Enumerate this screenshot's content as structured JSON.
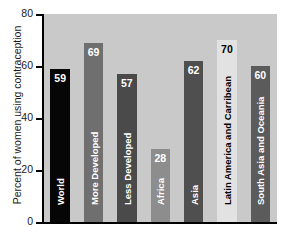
{
  "chart_data": {
    "type": "bar",
    "title": "",
    "xlabel": "",
    "ylabel": "Percent of women using contraception",
    "ylim": [
      0,
      80
    ],
    "yticks": [
      0,
      20,
      40,
      60,
      80
    ],
    "grid": false,
    "legend": false,
    "categories": [
      "World",
      "More Developed",
      "Less Developed",
      "Africa",
      "Asia",
      "Latin America and Carribean",
      "South Asia and Oceania"
    ],
    "values": [
      59,
      69,
      57,
      28,
      62,
      70,
      60
    ],
    "bar_colors": [
      "#060606",
      "#6f6f6f",
      "#4a4a4a",
      "#8d8d8d",
      "#4f4f4f",
      "#e2e2e2",
      "#5b5b5b"
    ],
    "value_label_text_colors": [
      "#ffffff",
      "#ffffff",
      "#ffffff",
      "#ffffff",
      "#ffffff",
      "#000000",
      "#ffffff"
    ],
    "category_label_text_colors": [
      "#ffffff",
      "#ffffff",
      "#ffffff",
      "#ffffff",
      "#ffffff",
      "#000000",
      "#ffffff"
    ],
    "plot_background": "#c9c9c9",
    "figure_background": "#ffffff",
    "axis_color": "#000000"
  },
  "ticks": {
    "t0": "0",
    "t20": "20",
    "t40": "40",
    "t60": "60",
    "t80": "80"
  }
}
